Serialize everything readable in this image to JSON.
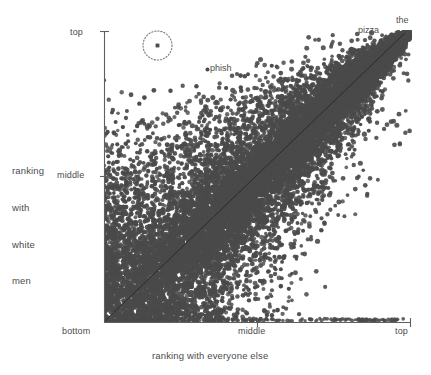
{
  "chart_data": {
    "type": "scatter",
    "title": "",
    "xlabel": "ranking with everyone else",
    "ylabel_lines": [
      "ranking",
      "with",
      "white",
      "men"
    ],
    "ylabel": "ranking with white men",
    "x_ticks": [
      {
        "label": "bottom",
        "pos": 0.0
      },
      {
        "label": "middle",
        "pos": 0.5
      },
      {
        "label": "top",
        "pos": 1.0
      }
    ],
    "y_ticks": [
      {
        "label": "middle",
        "pos": 0.5
      },
      {
        "label": "top",
        "pos": 1.0
      }
    ],
    "xlim": [
      0,
      1
    ],
    "ylim": [
      0,
      1
    ],
    "grid": false,
    "legend": false,
    "point_color": "#4a4a4a",
    "background": "#ffffff",
    "axis_color": "#5a5a5a",
    "identity_line": {
      "from": [
        0,
        0
      ],
      "to": [
        1,
        1
      ],
      "color": "#2e2e2e"
    },
    "annotations": [
      {
        "label": "the",
        "x": 0.985,
        "y": 0.985
      },
      {
        "label": "pizza",
        "x": 0.875,
        "y": 0.955
      },
      {
        "label": "phish",
        "x": 0.365,
        "y": 0.88,
        "marker": true
      },
      {
        "label": "",
        "x": 0.174,
        "y": 0.955,
        "circled": true,
        "circle_radius": 14
      }
    ],
    "point_count_approx": 9000
  },
  "axis_labels": {
    "y_top": "top",
    "y_middle": "middle",
    "x_bottom": "bottom",
    "x_middle": "middle",
    "x_top": "top"
  },
  "annotations": {
    "the": "the",
    "pizza": "pizza",
    "phish": "phish"
  },
  "titles": {
    "x_axis": "ranking with everyone else",
    "y_axis_line1": "ranking",
    "y_axis_line2": "with",
    "y_axis_line3": "white",
    "y_axis_line4": "men"
  }
}
